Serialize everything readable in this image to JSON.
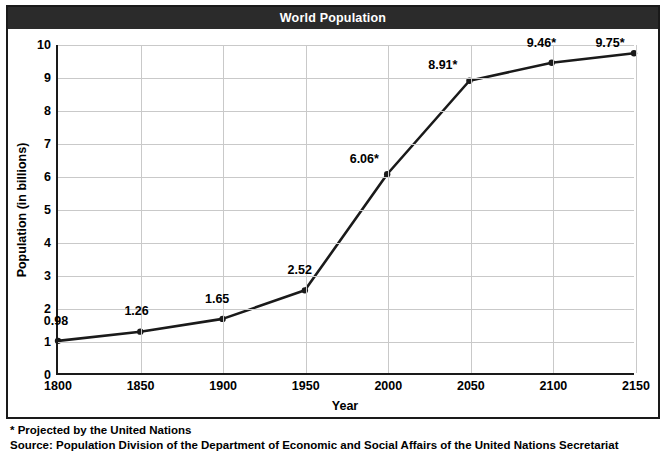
{
  "header": {
    "title": "World Population"
  },
  "footnotes": {
    "projection_note": "* Projected by the United Nations",
    "source": "Source: Population Division of the Department of Economic and Social Affairs of the United Nations Secretariat"
  },
  "chart_data": {
    "type": "line",
    "title": "World Population",
    "xlabel": "Year",
    "ylabel": "Population (in billions)",
    "xlim": [
      1800,
      2150
    ],
    "ylim": [
      0,
      10
    ],
    "xticks": [
      "1800",
      "1850",
      "1900",
      "1950",
      "2000",
      "2050",
      "2100",
      "2150"
    ],
    "yticks": [
      "0",
      "1",
      "2",
      "3",
      "4",
      "5",
      "6",
      "7",
      "8",
      "9",
      "10"
    ],
    "grid": true,
    "legend": "none",
    "line_color": "#1a1a1a",
    "marker_color": "#1a1a1a",
    "x": [
      1800,
      1850,
      1900,
      1950,
      2000,
      2050,
      2100,
      2150
    ],
    "values": [
      0.98,
      1.26,
      1.65,
      2.52,
      6.06,
      8.91,
      9.46,
      9.75
    ],
    "point_labels": [
      "0.98",
      "1.26",
      "1.65",
      "2.52",
      "6.06*",
      "8.91*",
      "9.46*",
      "9.75*"
    ]
  }
}
